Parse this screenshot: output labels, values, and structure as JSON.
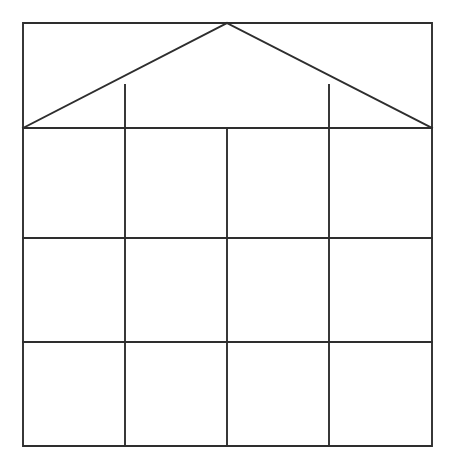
{
  "figure": {
    "background_color": "#fdfdfd",
    "line_color": "#2e2e2e",
    "fill_color": "#ffffff",
    "stroke_width": 1.9,
    "canvas": {
      "width": 452,
      "height": 466
    }
  },
  "chart_data": {
    "type": "diagram",
    "xlabel": "",
    "ylabel": "",
    "xlim": [
      0,
      452
    ],
    "ylim": [
      0,
      466
    ],
    "grid": true,
    "legend": "none",
    "bounds": {
      "left": 23,
      "top": 23,
      "right": 432,
      "bottom": 446
    },
    "vertical_gridlines_x": [
      23,
      125,
      227,
      329,
      432
    ],
    "horizontal_gridlines_y": [
      23,
      128,
      238,
      342,
      446
    ],
    "roof": {
      "apex": [
        227,
        23
      ],
      "left_eave": [
        23,
        128
      ],
      "right_eave": [
        432,
        128
      ],
      "inner_vertical_x": [
        125,
        329
      ],
      "inner_vertical_top_y": 85
    },
    "columns": 4,
    "rows": 3,
    "cell_counts": {
      "roof_band_cells": 3,
      "body_cells": 12
    },
    "annotations": []
  },
  "shapes": {
    "outer_rect": "M23,23 L432,23 L432,446 L23,446 Z",
    "roof_left_diagonal": "M23,128 L227,23",
    "roof_right_diagonal": "M227,23 L432,128",
    "eave_line": "M23,128 L432,128",
    "mid_row_line_1": "M23,238 L432,238",
    "mid_row_line_2": "M23,342 L432,342",
    "col_line_1_body": "M125,128 L125,446",
    "col_line_2_body": "M227,128 L227,446",
    "col_line_3_body": "M329,128 L329,446",
    "col_line_1_roof": "M125,85 L125,128",
    "col_line_3_roof": "M329,85 L329,128"
  }
}
